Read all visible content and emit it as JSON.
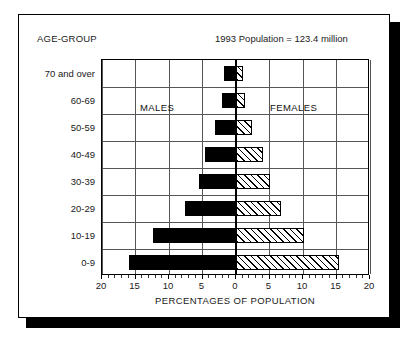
{
  "header": {
    "age_group_label": "AGE-GROUP",
    "population_note": "1993 Population = 123.4 million"
  },
  "chart_data": {
    "type": "bar",
    "title": "",
    "subtitle": "1993 Population = 123.4 million",
    "orientation": "horizontal",
    "layout": "population-pyramid",
    "xlabel": "PERCENTAGES OF POPULATION",
    "ylabel": "AGE-GROUP",
    "xlim": [
      -20,
      20
    ],
    "xticks": [
      -20,
      -15,
      -10,
      -5,
      0,
      5,
      10,
      15,
      20
    ],
    "xticklabels": [
      "20",
      "15",
      "10",
      "5",
      "0",
      "5",
      "10",
      "15",
      "20"
    ],
    "grid": true,
    "legend": [
      "MALES",
      "FEMALES"
    ],
    "legend_position": "inside-plot",
    "categories": [
      "70 and over",
      "60-69",
      "50-59",
      "40-49",
      "30-39",
      "20-29",
      "10-19",
      "0-9"
    ],
    "series": [
      {
        "name": "MALES",
        "side": "left",
        "fill": "solid-black",
        "color": "#000000",
        "values": [
          1.8,
          2.1,
          3.1,
          4.6,
          5.5,
          7.6,
          12.4,
          16.0
        ]
      },
      {
        "name": "FEMALES",
        "side": "right",
        "fill": "diagonal-hatch",
        "color": "#ffffff",
        "values": [
          1.1,
          1.4,
          2.4,
          4.0,
          5.0,
          6.7,
          10.2,
          15.4
        ]
      }
    ]
  }
}
